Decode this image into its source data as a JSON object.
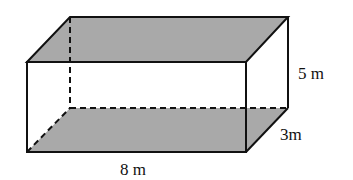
{
  "diagram": {
    "type": "rectangular-prism",
    "colors": {
      "shaded_face": "#a9a9a9",
      "edge": "#111111",
      "background": "#ffffff"
    },
    "labels": {
      "length": "8 m",
      "height": "5 m",
      "depth": "3m"
    },
    "shaded_faces": [
      "top",
      "bottom"
    ]
  }
}
